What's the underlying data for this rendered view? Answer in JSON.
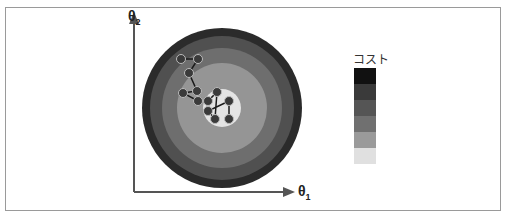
{
  "diagram": {
    "title": "",
    "axes": {
      "x_label": "θ",
      "x_sub": "1",
      "y_label": "θ",
      "y_sub": "2"
    },
    "legend": {
      "title": "コスト",
      "swatches": [
        "#111111",
        "#3a3a3a",
        "#555555",
        "#707070",
        "#9a9a9a",
        "#e0e0e0"
      ]
    },
    "contours": {
      "center": [
        222,
        108
      ],
      "rings": [
        {
          "r": 80,
          "color": "#2b2b2b"
        },
        {
          "r": 72,
          "color": "#505050"
        },
        {
          "r": 60,
          "color": "#6e6e6e"
        },
        {
          "r": 45,
          "color": "#959595"
        },
        {
          "r": 19,
          "color": "#e4e4e4"
        }
      ]
    },
    "path_points": [
      [
        181,
        59
      ],
      [
        198,
        59
      ],
      [
        189,
        73
      ],
      [
        197,
        91
      ],
      [
        183,
        93
      ],
      [
        198,
        101
      ],
      [
        208,
        101
      ],
      [
        217,
        92
      ],
      [
        215,
        119
      ],
      [
        208,
        111
      ],
      [
        229,
        101
      ],
      [
        229,
        119
      ]
    ]
  }
}
